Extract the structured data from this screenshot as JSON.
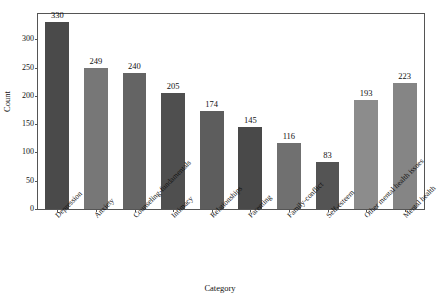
{
  "chart_data": {
    "type": "bar",
    "title": "",
    "xlabel": "Category",
    "ylabel": "Count",
    "categories": [
      "Depression",
      "Anxiety",
      "Counseling-fundamentals",
      "Intimacy",
      "Relationships",
      "Parenting",
      "Family-conflict",
      "Self-esteem",
      "Other mental health issues",
      "Mental health"
    ],
    "values": [
      330,
      249,
      240,
      205,
      174,
      145,
      116,
      83,
      193,
      223
    ],
    "bar_colors": [
      "#4a4a4a",
      "#777777",
      "#646464",
      "#4f4f4f",
      "#5d5d5d",
      "#494949",
      "#707070",
      "#545454",
      "#8c8c8c",
      "#858585"
    ],
    "ylim": [
      0,
      345
    ],
    "yticks": [
      0,
      50,
      100,
      150,
      200,
      250,
      300
    ],
    "ytick_labels": [
      "0",
      "50",
      "100",
      "150",
      "200",
      "250",
      "300"
    ],
    "grid": false,
    "legend": "none",
    "value_labels": [
      "330",
      "249",
      "240",
      "205",
      "174",
      "145",
      "116",
      "83",
      "193",
      "223"
    ]
  }
}
